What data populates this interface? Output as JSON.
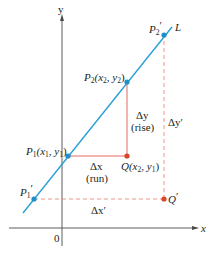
{
  "figure": {
    "colors": {
      "line": "#2a9fd6",
      "point_blue": "#1f8fc9",
      "point_red": "#d9452b",
      "solid_red": "#e0584a",
      "dashed_red": "#e98a7c",
      "axis": "#4a4a4a"
    },
    "axes": {
      "x_label": "x",
      "y_label": "y",
      "origin_label": "0"
    },
    "line": {
      "label": "L"
    },
    "points": {
      "p1": {
        "name": "P",
        "sub": "1",
        "coords": "(x",
        "cx_sub": "1",
        "mid": ", y",
        "cy_sub": "1",
        "close": ")"
      },
      "p2": {
        "name": "P",
        "sub": "2",
        "coords": "(x",
        "cx_sub": "2",
        "mid": ", y",
        "cy_sub": "2",
        "close": ")"
      },
      "q": {
        "name": "Q",
        "coords": "(x",
        "cx_sub": "2",
        "mid": ", y",
        "cy_sub": "1",
        "close": ")"
      },
      "p1_prime": {
        "name": "P",
        "sub": "1",
        "prime": "′"
      },
      "p2_prime": {
        "name": "P",
        "sub": "2",
        "prime": "′"
      },
      "q_prime": {
        "name": "Q",
        "prime": "′"
      }
    },
    "annotations": {
      "delta_y": "Δy",
      "rise": "(rise)",
      "delta_x": "Δx",
      "run": "(run)",
      "delta_y_prime": "Δy′",
      "delta_x_prime": "Δx′"
    }
  }
}
